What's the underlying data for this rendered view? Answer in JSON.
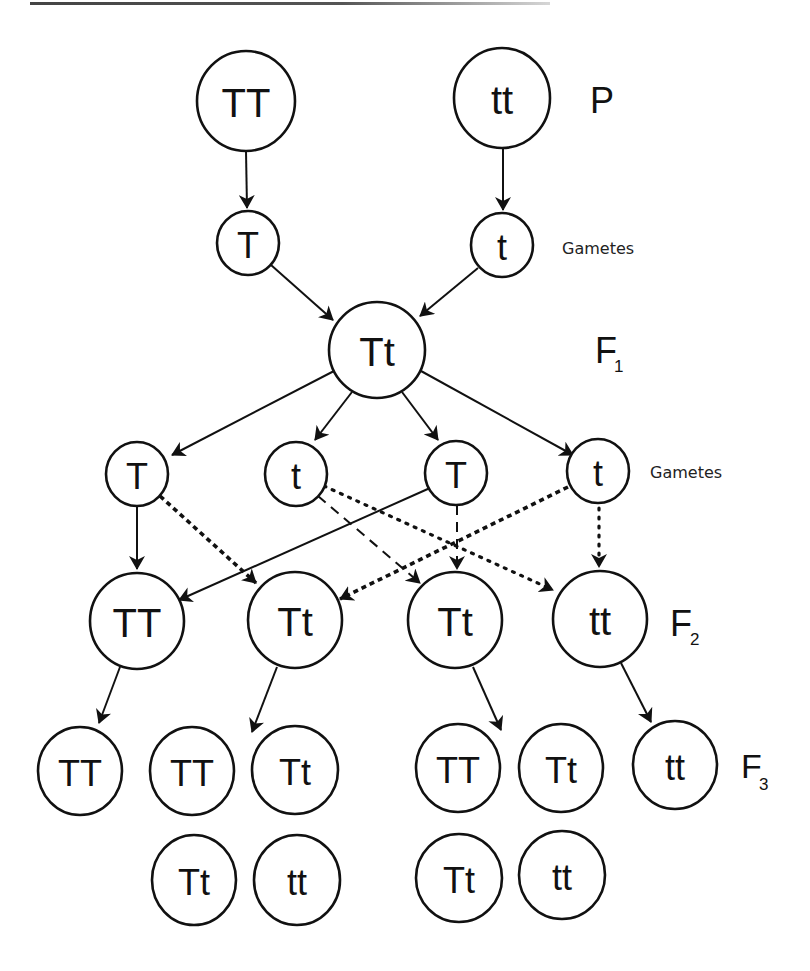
{
  "diagram": {
    "generation_labels": {
      "p": "P",
      "f1": "F",
      "f1_sub": "1",
      "f2": "F",
      "f2_sub": "2",
      "f3": "F",
      "f3_sub": "3",
      "gametes_1": "Gametes",
      "gametes_2": "Gametes"
    },
    "parents": [
      {
        "genotype": "TT"
      },
      {
        "genotype": "tt"
      }
    ],
    "parent_gametes": [
      {
        "allele": "T"
      },
      {
        "allele": "t"
      }
    ],
    "f1": [
      {
        "genotype": "Tt"
      }
    ],
    "f1_gametes": [
      {
        "allele": "T"
      },
      {
        "allele": "t"
      },
      {
        "allele": "T"
      },
      {
        "allele": "t"
      }
    ],
    "f2": [
      {
        "genotype": "TT"
      },
      {
        "genotype": "Tt"
      },
      {
        "genotype": "Tt"
      },
      {
        "genotype": "tt"
      }
    ],
    "f3": {
      "from_TT": [
        {
          "genotype": "TT"
        }
      ],
      "from_Tt_left": [
        {
          "genotype": "TT"
        },
        {
          "genotype": "Tt"
        },
        {
          "genotype": "Tt"
        },
        {
          "genotype": "tt"
        }
      ],
      "from_Tt_right": [
        {
          "genotype": "TT"
        },
        {
          "genotype": "Tt"
        },
        {
          "genotype": "Tt"
        },
        {
          "genotype": "tt"
        }
      ],
      "from_tt": [
        {
          "genotype": "tt"
        }
      ]
    },
    "line_styles": {
      "T1_to_TT": "solid",
      "T1_to_Tt1": "heavy-dashed",
      "t1_to_Tt2": "dashed",
      "t1_to_tt": "dotted",
      "T2_to_TT": "solid",
      "T2_to_Tt2": "dashed",
      "t2_to_Tt1": "heavy-dashed",
      "t2_to_tt": "dotted"
    }
  }
}
